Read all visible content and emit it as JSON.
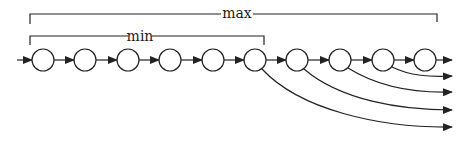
{
  "diagram": {
    "labels": {
      "max": "max",
      "min": "min"
    },
    "node_count": 10,
    "stroke_color": "#222222",
    "background": "#ffffff"
  }
}
